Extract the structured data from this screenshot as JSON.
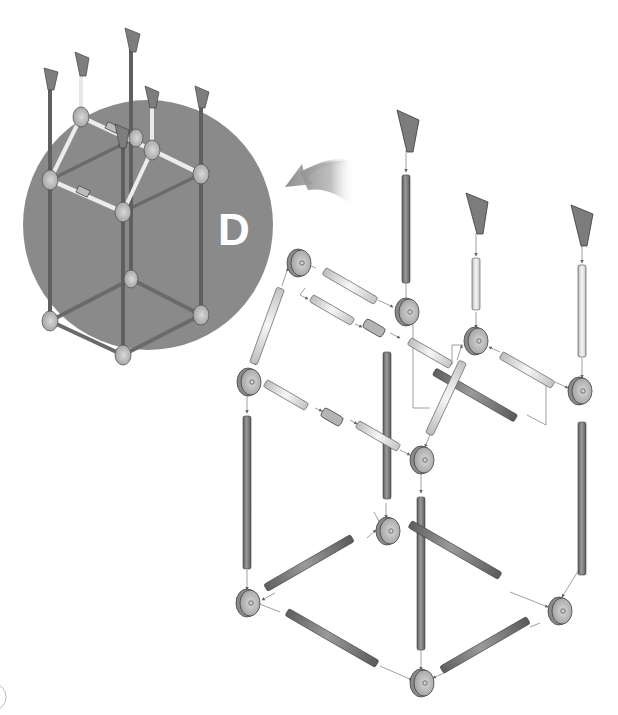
{
  "diagram": {
    "type": "exploded assembly instruction",
    "step_label": "D",
    "colors": {
      "background": "#ffffff",
      "inset_circle": "#8a8a8a",
      "dark_rod": "#7a7a7a",
      "light_rod": "#e6e6e6",
      "connector": "#a8a8a8",
      "foot_cap": "#8c8c8c",
      "arrow": "#9a9a9a",
      "guide_line": "#777777"
    },
    "inset": {
      "description": "Assembled frame preview inside gray circle",
      "center": [
        148,
        225
      ],
      "radius": 125
    },
    "direction_arrow": {
      "description": "curved gray arrow pointing left toward inset",
      "position": [
        290,
        185
      ]
    },
    "exploded_parts": {
      "connectors": 10,
      "dark_rods_vertical": 6,
      "dark_rods_horizontal": 6,
      "light_rods": 7,
      "couplers": 2,
      "top_caps": 3
    },
    "page_marker": {
      "description": "partial circle at bottom-left edge"
    }
  }
}
